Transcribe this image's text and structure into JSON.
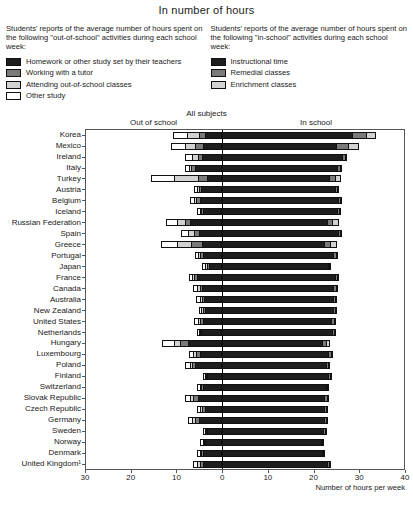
{
  "header": {
    "title": "In number of hours"
  },
  "legend_left": {
    "intro": "Students' reports of the average number of hours spent on the following \"out-of-school\" activities during each school week:",
    "items": [
      {
        "label": "Homework or other study set by their teachers",
        "color": "#1d1d1d"
      },
      {
        "label": "Working with a tutor",
        "color": "#7a7a7a"
      },
      {
        "label": "Attending out-of-school classes",
        "color": "#d2d2d2"
      },
      {
        "label": "Other study",
        "color": "#ffffff"
      }
    ]
  },
  "legend_right": {
    "intro": "Students' reports of the average number of hours spent on the following \"in-school\" activities during each school week:",
    "items": [
      {
        "label": "Instructional time",
        "color": "#1d1d1d"
      },
      {
        "label": "Remedial classes",
        "color": "#7a7a7a"
      },
      {
        "label": "Enrichment classes",
        "color": "#d2d2d2"
      }
    ]
  },
  "plot": {
    "subject_label": "All subjects",
    "side_left": "Out of school",
    "side_right": "In school",
    "axis_title": "Number of hours per week"
  },
  "chart_data": {
    "type": "bar",
    "orientation": "horizontal",
    "layout": "diverging-stacked",
    "title": "In number of hours",
    "subtitle": "All subjects",
    "xlabel": "Number of hours per week",
    "ylabel": "",
    "xlim": [
      -30,
      40
    ],
    "xticks": [
      -30,
      -20,
      -10,
      0,
      10,
      20,
      30,
      40
    ],
    "xticklabels": [
      "30",
      "20",
      "10",
      "0",
      "10",
      "20",
      "30",
      "40"
    ],
    "grid": false,
    "legend_position": "top",
    "series_left": [
      {
        "name": "Homework or other study set by their teachers",
        "color": "#1d1d1d"
      },
      {
        "name": "Working with a tutor",
        "color": "#7a7a7a"
      },
      {
        "name": "Attending out-of-school classes",
        "color": "#d2d2d2"
      },
      {
        "name": "Other study",
        "color": "#ffffff"
      }
    ],
    "series_right": [
      {
        "name": "Instructional time",
        "color": "#1d1d1d"
      },
      {
        "name": "Remedial classes",
        "color": "#7a7a7a"
      },
      {
        "name": "Enrichment classes",
        "color": "#d2d2d2"
      }
    ],
    "categories": [
      "Korea",
      "Mexico",
      "Ireland",
      "Italy",
      "Turkey",
      "Austria",
      "Belgium",
      "Iceland",
      "Russian Federation",
      "Spain",
      "Greece",
      "Portugal",
      "Japan",
      "France",
      "Canada",
      "Australia",
      "New Zealand",
      "United States",
      "Netherlands",
      "Hungary",
      "Luxembourg",
      "Poland",
      "Finland",
      "Switzerland",
      "Slovak Republic",
      "Czech Republic",
      "Germany",
      "Sweden",
      "Norway",
      "Denmark",
      "United Kingdom¹"
    ],
    "rows": [
      {
        "category": "Korea",
        "homework": 3.7,
        "tutor": 1.5,
        "outclasses": 2.6,
        "other": 3.0,
        "instructional": 28.5,
        "remedial": 3.2,
        "enrichment": 2.1
      },
      {
        "category": "Mexico",
        "homework": 4.2,
        "tutor": 1.8,
        "outclasses": 2.1,
        "other": 3.2,
        "instructional": 25.0,
        "remedial": 2.6,
        "enrichment": 2.4
      },
      {
        "category": "Ireland",
        "homework": 4.4,
        "tutor": 0.9,
        "outclasses": 1.3,
        "other": 1.6,
        "instructional": 26.5,
        "remedial": 0.5,
        "enrichment": 0.4
      },
      {
        "category": "Italy",
        "homework": 6.0,
        "tutor": 0.8,
        "outclasses": 0.5,
        "other": 1.0,
        "instructional": 25.5,
        "remedial": 0.5,
        "enrichment": 0.3
      },
      {
        "category": "Turkey",
        "homework": 3.4,
        "tutor": 2.0,
        "outclasses": 5.2,
        "other": 5.0,
        "instructional": 23.5,
        "remedial": 1.4,
        "enrichment": 1.2
      },
      {
        "category": "Austria",
        "homework": 4.6,
        "tutor": 0.6,
        "outclasses": 0.4,
        "other": 0.6,
        "instructional": 25.0,
        "remedial": 0.4,
        "enrichment": 0.3
      },
      {
        "category": "Belgium",
        "homework": 5.0,
        "tutor": 0.7,
        "outclasses": 0.5,
        "other": 0.9,
        "instructional": 25.5,
        "remedial": 0.6,
        "enrichment": 0.3
      },
      {
        "category": "Iceland",
        "homework": 4.3,
        "tutor": 0.4,
        "outclasses": 0.3,
        "other": 0.5,
        "instructional": 25.5,
        "remedial": 0.4,
        "enrichment": 0.2
      },
      {
        "category": "Russian Federation",
        "homework": 7.0,
        "tutor": 1.3,
        "outclasses": 1.6,
        "other": 2.6,
        "instructional": 23.0,
        "remedial": 1.2,
        "enrichment": 1.4
      },
      {
        "category": "Spain",
        "homework": 5.2,
        "tutor": 1.1,
        "outclasses": 1.2,
        "other": 1.6,
        "instructional": 25.5,
        "remedial": 0.5,
        "enrichment": 0.4
      },
      {
        "category": "Greece",
        "homework": 4.4,
        "tutor": 2.4,
        "outclasses": 3.2,
        "other": 3.6,
        "instructional": 22.5,
        "remedial": 1.3,
        "enrichment": 1.4
      },
      {
        "category": "Portugal",
        "homework": 4.2,
        "tutor": 0.6,
        "outclasses": 0.5,
        "other": 0.7,
        "instructional": 24.5,
        "remedial": 0.6,
        "enrichment": 0.3
      },
      {
        "category": "Japan",
        "homework": 3.0,
        "tutor": 0.4,
        "outclasses": 0.4,
        "other": 0.6,
        "instructional": 23.5,
        "remedial": 0.3,
        "enrichment": 0.2
      },
      {
        "category": "France",
        "homework": 5.6,
        "tutor": 0.7,
        "outclasses": 0.4,
        "other": 0.6,
        "instructional": 25.0,
        "remedial": 0.4,
        "enrichment": 0.2
      },
      {
        "category": "Canada",
        "homework": 4.4,
        "tutor": 0.6,
        "outclasses": 0.5,
        "other": 0.9,
        "instructional": 24.5,
        "remedial": 0.5,
        "enrichment": 0.4
      },
      {
        "category": "Australia",
        "homework": 4.0,
        "tutor": 0.5,
        "outclasses": 0.4,
        "other": 0.8,
        "instructional": 24.5,
        "remedial": 0.4,
        "enrichment": 0.3
      },
      {
        "category": "New Zealand",
        "homework": 3.9,
        "tutor": 0.4,
        "outclasses": 0.3,
        "other": 0.6,
        "instructional": 24.5,
        "remedial": 0.4,
        "enrichment": 0.3
      },
      {
        "category": "United States",
        "homework": 4.2,
        "tutor": 0.6,
        "outclasses": 0.5,
        "other": 1.0,
        "instructional": 24.0,
        "remedial": 0.6,
        "enrichment": 0.4
      },
      {
        "category": "Netherlands",
        "homework": 4.6,
        "tutor": 0.4,
        "outclasses": 0.2,
        "other": 0.3,
        "instructional": 24.5,
        "remedial": 0.3,
        "enrichment": 0.2
      },
      {
        "category": "Hungary",
        "homework": 7.6,
        "tutor": 1.6,
        "outclasses": 1.5,
        "other": 2.5,
        "instructional": 22.0,
        "remedial": 0.8,
        "enrichment": 0.9
      },
      {
        "category": "Luxembourg",
        "homework": 4.8,
        "tutor": 1.0,
        "outclasses": 0.6,
        "other": 1.0,
        "instructional": 23.5,
        "remedial": 0.5,
        "enrichment": 0.3
      },
      {
        "category": "Poland",
        "homework": 6.0,
        "tutor": 0.6,
        "outclasses": 0.5,
        "other": 1.0,
        "instructional": 23.0,
        "remedial": 0.4,
        "enrichment": 0.3
      },
      {
        "category": "Finland",
        "homework": 3.4,
        "tutor": 0.3,
        "outclasses": 0.2,
        "other": 0.4,
        "instructional": 23.5,
        "remedial": 0.4,
        "enrichment": 0.2
      },
      {
        "category": "Switzerland",
        "homework": 4.2,
        "tutor": 0.5,
        "outclasses": 0.3,
        "other": 0.5,
        "instructional": 23.0,
        "remedial": 0.3,
        "enrichment": 0.2
      },
      {
        "category": "Slovak Republic",
        "homework": 5.4,
        "tutor": 1.0,
        "outclasses": 0.7,
        "other": 1.0,
        "instructional": 22.5,
        "remedial": 0.6,
        "enrichment": 0.5
      },
      {
        "category": "Czech Republic",
        "homework": 3.8,
        "tutor": 0.6,
        "outclasses": 0.4,
        "other": 0.7,
        "instructional": 22.5,
        "remedial": 0.4,
        "enrichment": 0.3
      },
      {
        "category": "Germany",
        "homework": 5.2,
        "tutor": 0.9,
        "outclasses": 0.5,
        "other": 0.9,
        "instructional": 22.5,
        "remedial": 0.4,
        "enrichment": 0.3
      },
      {
        "category": "Sweden",
        "homework": 3.4,
        "tutor": 0.3,
        "outclasses": 0.2,
        "other": 0.4,
        "instructional": 22.5,
        "remedial": 0.3,
        "enrichment": 0.2
      },
      {
        "category": "Norway",
        "homework": 3.8,
        "tutor": 0.3,
        "outclasses": 0.2,
        "other": 0.5,
        "instructional": 22.0,
        "remedial": 0.3,
        "enrichment": 0.2
      },
      {
        "category": "Denmark",
        "homework": 4.2,
        "tutor": 0.4,
        "outclasses": 0.3,
        "other": 0.6,
        "instructional": 22.0,
        "remedial": 0.4,
        "enrichment": 0.3
      },
      {
        "category": "United Kingdom¹",
        "homework": 4.2,
        "tutor": 0.7,
        "outclasses": 0.6,
        "other": 1.0,
        "instructional": 23.0,
        "remedial": 0.5,
        "enrichment": 0.4
      }
    ]
  }
}
